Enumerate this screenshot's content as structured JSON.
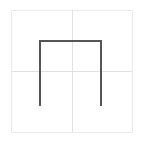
{
  "canvas": {
    "width": 143,
    "height": 142,
    "background_color": "#ffffff",
    "title": "Glyph preview"
  },
  "frame": {
    "name": "em-square-frame",
    "x": 11,
    "y": 10,
    "width": 121,
    "height": 122,
    "stroke_color": "#ebebeb",
    "stroke_width": 1,
    "fill": "none"
  },
  "guides": {
    "stroke_color": "#e2e2e2",
    "stroke_width": 1,
    "vertical": {
      "name": "vertical-center-guide",
      "x": 72,
      "y1": 10,
      "y2": 132
    },
    "horizontal": {
      "name": "horizontal-center-guide",
      "y": 71,
      "x1": 11,
      "x2": 132
    }
  },
  "glyph": {
    "name": "pi-shape-path",
    "description": "open-bottom rectangle, pi / staple shape",
    "stroke_color": "#565656",
    "stroke_width": 2,
    "fill": "none",
    "points": [
      {
        "x": 40,
        "y": 106
      },
      {
        "x": 40,
        "y": 41
      },
      {
        "x": 101,
        "y": 41
      },
      {
        "x": 101,
        "y": 106
      }
    ],
    "path": "M 40 106 L 40 41 L 101 41 L 101 106",
    "metrics": {
      "left_stem_x": 40,
      "right_stem_x": 101,
      "crossbar_y": 41,
      "baseline_y": 106,
      "advance_width": 61,
      "height": 65
    }
  }
}
